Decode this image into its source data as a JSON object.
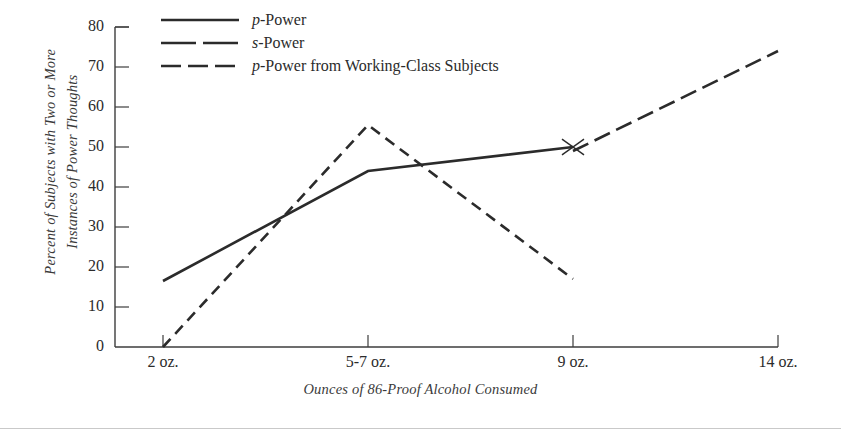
{
  "chart_data": {
    "type": "line",
    "title": "",
    "xlabel": "Ounces of 86-Proof Alcohol Consumed",
    "ylabel": "Percent of Subjects with Two or More\nInstances of Power Thoughts",
    "categories": [
      "2 oz.",
      "5-7 oz.",
      "9 oz.",
      "14 oz."
    ],
    "x_positions": [
      163,
      368,
      573,
      778
    ],
    "ylim": [
      0,
      80
    ],
    "yticks": [
      0,
      10,
      20,
      30,
      40,
      50,
      60,
      70,
      80
    ],
    "grid": false,
    "legend_position": "top-left",
    "series": [
      {
        "name": "p-Power",
        "style": "solid",
        "points": [
          {
            "x": "2 oz.",
            "y": 16.5
          },
          {
            "x": "5-7 oz.",
            "y": 44
          },
          {
            "x": "9 oz.",
            "y": 50
          }
        ]
      },
      {
        "name": "s-Power",
        "style": "dashed-medium",
        "points": [
          {
            "x": "2 oz.",
            "y": 0
          },
          {
            "x": "5-7 oz.",
            "y": 55.5
          },
          {
            "x": "9 oz.",
            "y": 17
          }
        ]
      },
      {
        "name": "p-Power from Working-Class Subjects",
        "style": "dashed-long",
        "points": [
          {
            "x": "9 oz.",
            "y": 49
          },
          {
            "x": "14 oz.",
            "y": 74
          }
        ]
      }
    ],
    "annotations": [
      {
        "kind": "x-cross-mark",
        "x": "9 oz.",
        "y": 50
      }
    ]
  },
  "axis": {
    "y_tick_labels": [
      "80",
      "70",
      "60",
      "50",
      "40",
      "30",
      "20",
      "10",
      "0"
    ],
    "x_tick_labels": [
      "2 oz.",
      "5-7 oz.",
      "9 oz.",
      "14 oz."
    ],
    "y_axis_title": "Percent of Subjects with Two or More\nInstances of Power Thoughts",
    "x_axis_title": "Ounces of 86-Proof Alcohol Consumed"
  },
  "legend": {
    "items": [
      {
        "label_prefix": "p",
        "label_rest": "-Power",
        "style": "solid"
      },
      {
        "label_prefix": "s",
        "label_rest": "-Power",
        "style": "dashed-long"
      },
      {
        "label_prefix": "p",
        "label_rest": "-Power from Working-Class Subjects",
        "style": "dashed-medium"
      }
    ]
  },
  "colors": {
    "ink": "#2b2b2b",
    "axis": "#3d3d3d",
    "background": "#ffffff",
    "rule": "#c9c9c9"
  }
}
